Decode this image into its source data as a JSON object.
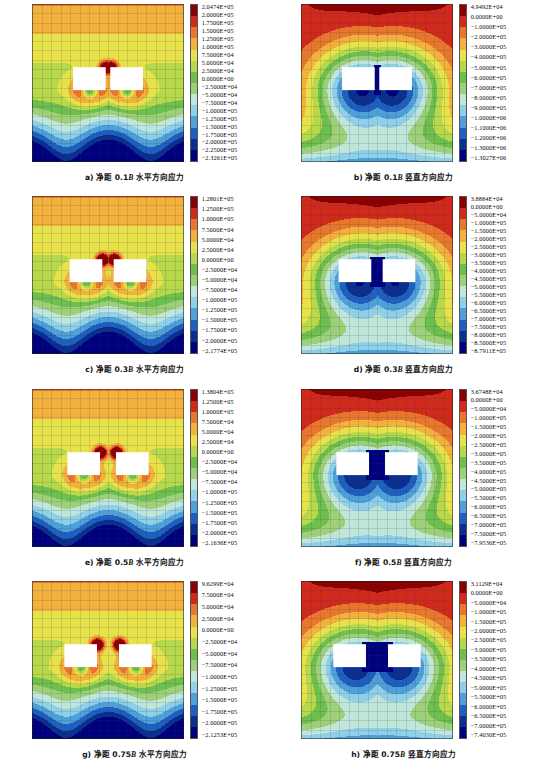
{
  "figure": {
    "title_hidden": "",
    "panel_count": 8
  },
  "chart_data": {
    "type": "heatmap",
    "colormap": [
      "#00007f",
      "#0b2f8f",
      "#1f5fbf",
      "#4f9fd8",
      "#8fd0e8",
      "#bfe6d8",
      "#9ed07a",
      "#6fbf4f",
      "#b7d84a",
      "#e8e24a",
      "#f2b03c",
      "#e8762c",
      "#cf2a1c",
      "#8b0000"
    ],
    "legend_position": "right",
    "grid": true,
    "panels": [
      {
        "id": "a",
        "caption_prefix": "a) 净距 0.1",
        "caption_symbol": "B",
        "caption_suffix": " 水平方向应力",
        "spacing": "0.1B",
        "component": "horizontal",
        "max": "2.0474E+05",
        "min": "-2.3261E+05",
        "ticks": [
          "2.0474E+05",
          "2.0000E+05",
          "1.7500E+05",
          "1.5000E+05",
          "1.2500E+05",
          "1.0000E+05",
          "7.5000E+04",
          "5.0000E+04",
          "2.5000E+04",
          "0.0000E+00",
          "−2.5000E+04",
          "−5.0000E+04",
          "−7.5000E+04",
          "−1.0000E+05",
          "−1.2500E+05",
          "−1.5000E+05",
          "−1.7500E+05",
          "−2.0000E+05",
          "−2.2500E+05",
          "−2.3261E+05"
        ]
      },
      {
        "id": "b",
        "caption_prefix": "b) 净距 0.1",
        "caption_symbol": "B",
        "caption_suffix": " 竖直方向应力",
        "spacing": "0.1B",
        "component": "vertical",
        "max": "4.9492E+04",
        "min": "-1.3027E+06",
        "ticks": [
          "4.9492E+04",
          "0.0000E+00",
          "−1.0000E+05",
          "−2.0000E+05",
          "−3.0000E+05",
          "−4.0000E+05",
          "−5.0000E+05",
          "−6.0000E+05",
          "−7.0000E+05",
          "−8.0000E+05",
          "−9.0000E+05",
          "−1.0000E+06",
          "−1.1000E+06",
          "−1.2000E+06",
          "−1.3000E+06",
          "−1.3027E+06"
        ]
      },
      {
        "id": "c",
        "caption_prefix": "c) 净距 0.3",
        "caption_symbol": "B",
        "caption_suffix": " 水平方向应力",
        "spacing": "0.3B",
        "component": "horizontal",
        "max": "1.2801E+05",
        "min": "-2.1774E+05",
        "ticks": [
          "1.2801E+05",
          "1.2500E+05",
          "1.0000E+05",
          "7.5000E+04",
          "5.0000E+04",
          "2.5000E+04",
          "0.0000E+00",
          "−2.5000E+04",
          "−5.0000E+04",
          "−7.5000E+04",
          "−1.0000E+05",
          "−1.2500E+05",
          "−1.5000E+05",
          "−1.7500E+05",
          "−2.0000E+05",
          "−2.1774E+05"
        ]
      },
      {
        "id": "d",
        "caption_prefix": "d) 净距 0.3",
        "caption_symbol": "B",
        "caption_suffix": " 竖直方向应力",
        "spacing": "0.3B",
        "component": "vertical",
        "max": "3.8884E+04",
        "min": "-8.7911E+05",
        "ticks": [
          "3.8884E+04",
          "0.0000E+00",
          "−5.0000E+04",
          "−1.0000E+05",
          "−1.5000E+05",
          "−2.0000E+05",
          "−2.5000E+05",
          "−3.0000E+05",
          "−3.5000E+05",
          "−4.0000E+05",
          "−4.5000E+05",
          "−5.0000E+05",
          "−5.5000E+05",
          "−6.0000E+05",
          "−6.5000E+05",
          "−7.0000E+05",
          "−7.5000E+05",
          "−8.0000E+05",
          "−8.5000E+05",
          "−8.7911E+05"
        ]
      },
      {
        "id": "e",
        "caption_prefix": "e) 净距 0.5",
        "caption_symbol": "B",
        "caption_suffix": " 水平方向应力",
        "spacing": "0.5B",
        "component": "horizontal",
        "max": "1.3804E+05",
        "min": "-2.1636E+05",
        "ticks": [
          "1.3804E+05",
          "1.2500E+05",
          "1.0000E+05",
          "7.5000E+04",
          "5.0000E+04",
          "2.5000E+04",
          "0.0000E+00",
          "−2.5000E+04",
          "−5.0000E+04",
          "−7.5000E+04",
          "−1.0000E+05",
          "−1.2500E+05",
          "−1.5000E+05",
          "−1.7500E+05",
          "−2.0000E+05",
          "−2.1636E+05"
        ]
      },
      {
        "id": "f",
        "caption_prefix": "f) 净距 0.5",
        "caption_symbol": "B",
        "caption_suffix": " 竖直方向应力",
        "spacing": "0.5B",
        "component": "vertical",
        "max": "3.6748E+04",
        "min": "-7.9536E+05",
        "ticks": [
          "3.6748E+04",
          "0.0000E+00",
          "−5.0000E+04",
          "−1.0000E+05",
          "−1.5000E+05",
          "−2.0000E+05",
          "−2.5000E+05",
          "−3.0000E+05",
          "−3.5000E+05",
          "−4.0000E+05",
          "−4.5000E+05",
          "−5.0000E+05",
          "−5.5000E+05",
          "−6.0000E+05",
          "−6.5000E+05",
          "−7.0000E+05",
          "−7.5000E+05",
          "−7.9536E+05"
        ]
      },
      {
        "id": "g",
        "caption_prefix": "g) 净距 0.75",
        "caption_symbol": "B",
        "caption_suffix": " 水平方向应力",
        "spacing": "0.75B",
        "component": "horizontal",
        "max": "9.6299E+04",
        "min": "-2.1253E+05",
        "ticks": [
          "9.6299E+04",
          "7.5000E+04",
          "5.0000E+04",
          "2.5000E+04",
          "0.0000E+00",
          "−2.5000E+04",
          "−5.0000E+04",
          "−7.5000E+04",
          "−1.0000E+05",
          "−1.2500E+05",
          "−1.5000E+05",
          "−1.7500E+05",
          "−2.0000E+05",
          "−2.1253E+05"
        ]
      },
      {
        "id": "h",
        "caption_prefix": "h) 净距 0.75",
        "caption_symbol": "B",
        "caption_suffix": " 竖直方向应力",
        "spacing": "0.75B",
        "component": "vertical",
        "max": "3.1129E+04",
        "min": "-7.4030E+05",
        "ticks": [
          "3.1129E+04",
          "0.0000E+00",
          "−5.0000E+04",
          "−1.0000E+05",
          "−1.5000E+05",
          "−2.0000E+05",
          "−2.5000E+05",
          "−3.0000E+05",
          "−3.5000E+05",
          "−4.0000E+05",
          "−4.5000E+05",
          "−5.0000E+05",
          "−5.5000E+05",
          "−6.0000E+05",
          "−6.5000E+05",
          "−7.0000E+05",
          "−7.4030E+05"
        ]
      }
    ]
  }
}
